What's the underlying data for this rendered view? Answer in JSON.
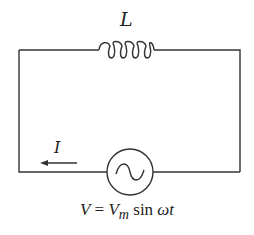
{
  "diagram": {
    "type": "AC circuit with inductor",
    "inductor_label": "L",
    "current_label": "I",
    "source_symbol": "ac-voltage-source",
    "equation": {
      "lhs": "V",
      "equals": "=",
      "vm_base": "V",
      "vm_sub": "m",
      "func": "sin",
      "arg": "ωt"
    },
    "colors": {
      "wire": "#333333",
      "background": "#ffffff"
    }
  }
}
